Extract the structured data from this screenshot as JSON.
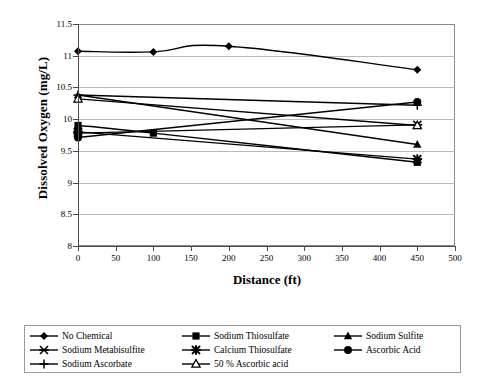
{
  "chart_data": {
    "type": "line",
    "title": "",
    "xlabel": "Distance (ft)",
    "ylabel": "Dissolved Oxygen (mg/L)",
    "xlim": [
      0,
      500
    ],
    "ylim": [
      8,
      11.5
    ],
    "xticks": [
      0,
      50,
      100,
      150,
      200,
      250,
      300,
      350,
      400,
      450,
      500
    ],
    "yticks": [
      8,
      8.5,
      9,
      9.5,
      10,
      10.5,
      11,
      11.5
    ],
    "grid": "horizontal",
    "legend_position": "bottom",
    "series_color": "#000000",
    "series": [
      {
        "name": "No Chemical",
        "marker": "filled-diamond",
        "x": [
          0,
          100,
          200,
          450
        ],
        "values": [
          11.07,
          11.06,
          11.15,
          10.78
        ]
      },
      {
        "name": "Sodium Thiosulfate",
        "marker": "filled-square",
        "x": [
          0,
          100,
          450
        ],
        "values": [
          9.9,
          9.78,
          9.32
        ]
      },
      {
        "name": "Sodium Sulfite",
        "marker": "filled-triangle",
        "x": [
          0,
          450
        ],
        "values": [
          10.38,
          9.6
        ]
      },
      {
        "name": "Sodium Metabisulfite",
        "marker": "star-x",
        "x": [
          0,
          450
        ],
        "values": [
          9.78,
          9.91
        ]
      },
      {
        "name": "Calcium Thiosulfate",
        "marker": "star-bold",
        "x": [
          0,
          450
        ],
        "values": [
          9.8,
          9.37
        ]
      },
      {
        "name": "Ascorbic Acid",
        "marker": "filled-circle",
        "x": [
          0,
          450
        ],
        "values": [
          9.71,
          10.27
        ]
      },
      {
        "name": "Sodium Ascorbate",
        "marker": "plus",
        "x": [
          0,
          450
        ],
        "values": [
          10.38,
          10.22
        ]
      },
      {
        "name": "50 % Ascorbic acid",
        "marker": "open-triangle",
        "x": [
          0,
          450
        ],
        "values": [
          10.32,
          9.9
        ]
      }
    ]
  },
  "legend": {
    "entries": [
      {
        "label": "No Chemical",
        "marker": "filled-diamond"
      },
      {
        "label": "Sodium Thiosulfate",
        "marker": "filled-square"
      },
      {
        "label": "Sodium Sulfite",
        "marker": "filled-triangle"
      },
      {
        "label": "Sodium Metabisulfite",
        "marker": "star-x"
      },
      {
        "label": "Calcium Thiosulfate",
        "marker": "star-bold"
      },
      {
        "label": "Ascorbic Acid",
        "marker": "filled-circle"
      },
      {
        "label": "Sodium Ascorbate",
        "marker": "plus"
      },
      {
        "label": "50 % Ascorbic acid",
        "marker": "open-triangle"
      }
    ]
  }
}
